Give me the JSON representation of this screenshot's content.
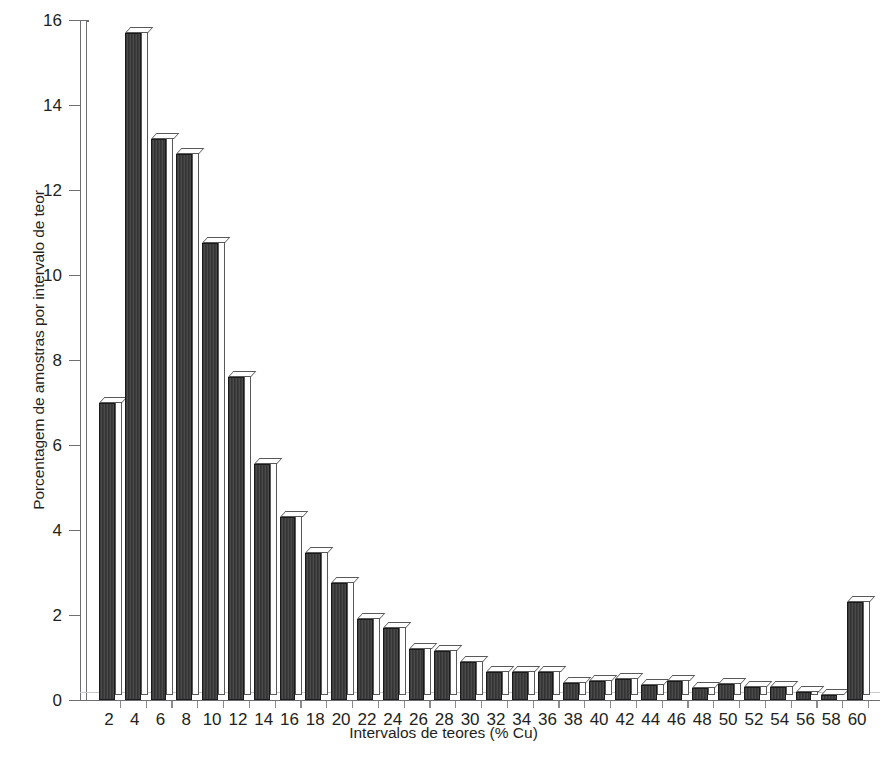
{
  "chart_data": {
    "type": "bar",
    "title": "",
    "xlabel": "Intervalos de teores (% Cu)",
    "ylabel": "Porcentagem de amostras por intervalo de teor",
    "categories": [
      "2",
      "4",
      "6",
      "8",
      "10",
      "12",
      "14",
      "16",
      "18",
      "20",
      "22",
      "24",
      "26",
      "28",
      "30",
      "32",
      "34",
      "36",
      "38",
      "40",
      "42",
      "44",
      "46",
      "48",
      "50",
      "52",
      "54",
      "56",
      "58",
      "60"
    ],
    "values": [
      7.0,
      15.7,
      13.2,
      12.85,
      10.75,
      7.6,
      5.55,
      4.3,
      3.45,
      2.75,
      1.9,
      1.7,
      1.2,
      1.15,
      0.9,
      0.65,
      0.65,
      0.65,
      0.4,
      0.45,
      0.5,
      0.35,
      0.45,
      0.28,
      0.38,
      0.3,
      0.3,
      0.2,
      0.12,
      2.3
    ],
    "ylim": [
      0,
      16
    ],
    "yticks": [
      "0",
      "2",
      "4",
      "6",
      "8",
      "10",
      "12",
      "14",
      "16"
    ],
    "ytick_values": [
      0,
      2,
      4,
      6,
      8,
      10,
      12,
      14,
      16
    ],
    "xlim_labels": [
      "2",
      "60"
    ],
    "grid": false,
    "legend": null,
    "bar_style": "3d-extruded",
    "bar_fill_color": "#3c3c3c",
    "bar_top_color": "#fdfdfd",
    "bar_outline_color": "#58595b",
    "axis_color": "#6d6e71",
    "text_color": "#231f20",
    "background_color": "#ffffff"
  }
}
